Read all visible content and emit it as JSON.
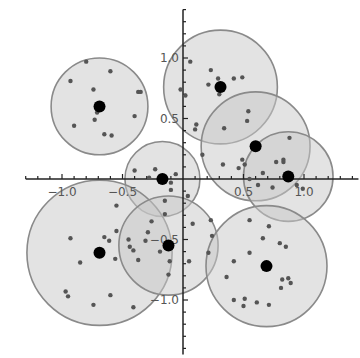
{
  "chart_data": {
    "type": "scatter",
    "title": "",
    "xlabel": "",
    "ylabel": "",
    "xlim": [
      -1.3,
      1.45
    ],
    "ylim": [
      -1.45,
      1.4
    ],
    "grid": false,
    "legend": null,
    "axes_origin": [
      0,
      0
    ],
    "x_ticks_major": [
      -1.0,
      -0.5,
      0.5,
      1.0
    ],
    "y_ticks_major": [
      1.0,
      0.5,
      -0.5,
      -1.0
    ],
    "x_tick_labels": [
      "-1.0",
      "-0.5",
      "0.5",
      "1.0"
    ],
    "y_tick_labels": [
      "1.0",
      "0.5",
      "-0.5",
      "-1.0"
    ],
    "minor_tick_step": 0.1,
    "colors": {
      "circle_fill": "#c8c8c8",
      "circle_fill_opacity": 0.5,
      "circle_stroke": "#8a8a8a",
      "point": "#555555",
      "centroid": "#000000",
      "axis": "#222222",
      "tick_label": "#555555"
    },
    "clusters": [
      {
        "name": "cluster-1",
        "center": [
          -0.69,
          0.6
        ],
        "radius": 0.4,
        "points": [
          [
            -0.8,
            0.97
          ],
          [
            -0.6,
            0.89
          ],
          [
            -0.93,
            0.81
          ],
          [
            -0.74,
            0.74
          ],
          [
            -0.37,
            0.72
          ],
          [
            -0.35,
            0.72
          ],
          [
            -0.69,
            0.58
          ],
          [
            -0.71,
            0.55
          ],
          [
            -0.73,
            0.49
          ],
          [
            -0.4,
            0.52
          ],
          [
            -0.9,
            0.44
          ],
          [
            -0.65,
            0.37
          ],
          [
            -0.59,
            0.36
          ]
        ]
      },
      {
        "name": "cluster-2",
        "center": [
          0.31,
          0.76
        ],
        "radius": 0.47,
        "points": [
          [
            0.06,
            0.97
          ],
          [
            0.23,
            0.9
          ],
          [
            0.29,
            0.83
          ],
          [
            0.42,
            0.83
          ],
          [
            0.49,
            0.84
          ],
          [
            0.21,
            0.78
          ],
          [
            0.3,
            0.7
          ],
          [
            0.02,
            0.69
          ],
          [
            -0.02,
            0.74
          ],
          [
            0.54,
            0.56
          ],
          [
            0.53,
            0.48
          ],
          [
            0.1,
            0.41
          ]
        ]
      },
      {
        "name": "cluster-3",
        "center": [
          0.6,
          0.27
        ],
        "radius": 0.45,
        "points": [
          [
            0.11,
            0.45
          ],
          [
            0.34,
            0.42
          ],
          [
            0.88,
            0.34
          ],
          [
            0.63,
            0.28
          ],
          [
            0.49,
            0.16
          ],
          [
            0.83,
            0.16
          ],
          [
            0.83,
            0.14
          ],
          [
            0.16,
            0.2
          ],
          [
            0.33,
            0.12
          ],
          [
            0.46,
            0.09
          ]
        ]
      },
      {
        "name": "cluster-4",
        "center": [
          0.87,
          0.02
        ],
        "radius": 0.37,
        "points": [
          [
            0.51,
            0.12
          ],
          [
            0.66,
            0.05
          ],
          [
            0.77,
            0.14
          ],
          [
            0.55,
            0.0
          ],
          [
            0.62,
            -0.05
          ],
          [
            0.74,
            -0.07
          ],
          [
            0.94,
            -0.05
          ],
          [
            0.99,
            -0.08
          ]
        ]
      },
      {
        "name": "cluster-5",
        "center": [
          -0.17,
          0.0
        ],
        "radius": 0.31,
        "points": [
          [
            -0.4,
            0.07
          ],
          [
            -0.23,
            0.08
          ],
          [
            -0.06,
            0.04
          ],
          [
            -0.1,
            -0.03
          ],
          [
            -0.28,
            0.01
          ],
          [
            -0.1,
            -0.09
          ],
          [
            0.04,
            -0.14
          ],
          [
            -0.15,
            -0.18
          ]
        ]
      },
      {
        "name": "cluster-6",
        "center": [
          -0.69,
          -0.61
        ],
        "radius": 0.6,
        "points": [
          [
            -0.55,
            -0.22
          ],
          [
            -0.55,
            -0.43
          ],
          [
            -0.93,
            -0.49
          ],
          [
            -0.65,
            -0.48
          ],
          [
            -0.61,
            -0.51
          ],
          [
            -0.45,
            -0.5
          ],
          [
            -0.85,
            -0.69
          ],
          [
            -0.56,
            -0.66
          ],
          [
            -0.97,
            -0.93
          ],
          [
            -0.95,
            -0.97
          ],
          [
            -0.6,
            -0.96
          ],
          [
            -0.74,
            -1.04
          ],
          [
            -0.41,
            -1.06
          ],
          [
            -0.37,
            -0.67
          ]
        ]
      },
      {
        "name": "cluster-7",
        "center": [
          -0.12,
          -0.55
        ],
        "radius": 0.41,
        "points": [
          [
            -0.26,
            -0.35
          ],
          [
            -0.15,
            -0.29
          ],
          [
            -0.29,
            -0.44
          ],
          [
            -0.31,
            -0.51
          ],
          [
            -0.44,
            -0.56
          ],
          [
            -0.41,
            -0.59
          ],
          [
            -0.19,
            -0.6
          ],
          [
            -0.11,
            -0.68
          ],
          [
            0.05,
            -0.68
          ],
          [
            -0.12,
            -0.79
          ],
          [
            0.24,
            -0.47
          ],
          [
            0.08,
            -0.37
          ]
        ]
      },
      {
        "name": "cluster-8",
        "center": [
          0.69,
          -0.72
        ],
        "radius": 0.5,
        "points": [
          [
            0.71,
            -0.39
          ],
          [
            0.66,
            -0.49
          ],
          [
            0.8,
            -0.53
          ],
          [
            0.85,
            -0.56
          ],
          [
            0.55,
            -0.61
          ],
          [
            0.42,
            -0.68
          ],
          [
            0.36,
            -0.81
          ],
          [
            0.82,
            -0.83
          ],
          [
            0.87,
            -0.82
          ],
          [
            0.89,
            -0.86
          ],
          [
            0.81,
            -0.9
          ],
          [
            0.42,
            -1.0
          ],
          [
            0.51,
            -0.99
          ],
          [
            0.61,
            -1.02
          ],
          [
            0.71,
            -1.04
          ],
          [
            0.5,
            -1.05
          ],
          [
            0.21,
            -0.61
          ],
          [
            0.23,
            -0.34
          ],
          [
            0.55,
            -0.34
          ]
        ]
      }
    ]
  }
}
